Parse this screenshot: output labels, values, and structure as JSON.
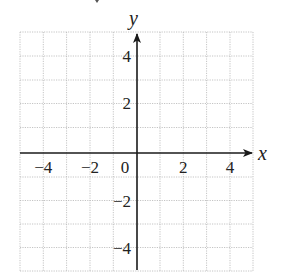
{
  "diagram": {
    "type": "coordinate-grid",
    "x_axis": {
      "label": "x",
      "range": [
        -5,
        5
      ],
      "tick_labels": [
        {
          "value": -4,
          "text": "−4"
        },
        {
          "value": -2,
          "text": "−2"
        },
        {
          "value": 0,
          "text": "0"
        },
        {
          "value": 2,
          "text": "2"
        },
        {
          "value": 4,
          "text": "4"
        }
      ]
    },
    "y_axis": {
      "label": "y",
      "range": [
        -5,
        5
      ],
      "tick_labels": [
        {
          "value": 4,
          "text": "4"
        },
        {
          "value": 2,
          "text": "2"
        },
        {
          "value": -2,
          "text": "−2"
        },
        {
          "value": -4,
          "text": "−4"
        }
      ]
    },
    "grid": {
      "on": true,
      "step": 1,
      "style": "dotted"
    },
    "colors": {
      "grid": "#b5b5b5",
      "axis": "#1a1a1a",
      "text": "#222222"
    }
  }
}
